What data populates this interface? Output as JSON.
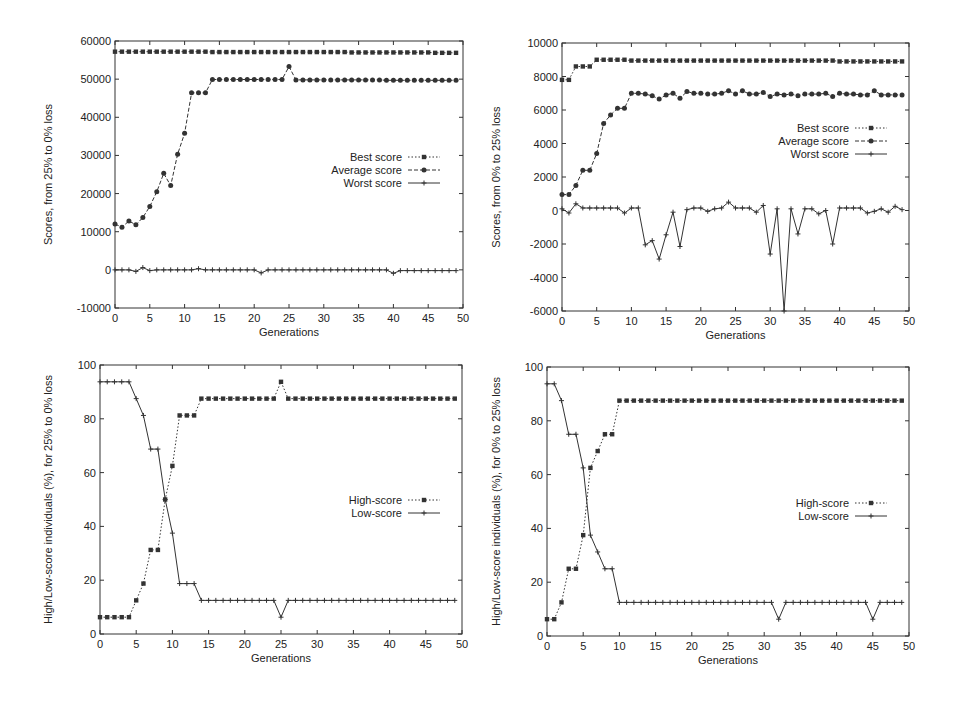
{
  "chart_data": [
    {
      "id": "top-left",
      "type": "line",
      "title": "",
      "xlabel": "Generations",
      "ylabel": "Scores, from 25% to 0% loss",
      "xlim": [
        0,
        50
      ],
      "ylim": [
        -10000,
        60000
      ],
      "xticks": [
        0,
        5,
        10,
        15,
        20,
        25,
        30,
        35,
        40,
        45,
        50
      ],
      "yticks": [
        -10000,
        0,
        10000,
        20000,
        30000,
        40000,
        50000,
        60000
      ],
      "grid": false,
      "legend_position": "center-right",
      "x": [
        0,
        1,
        2,
        3,
        4,
        5,
        6,
        7,
        8,
        9,
        10,
        11,
        12,
        13,
        14,
        15,
        16,
        17,
        18,
        19,
        20,
        21,
        22,
        23,
        24,
        25,
        26,
        27,
        28,
        29,
        30,
        31,
        32,
        33,
        34,
        35,
        36,
        37,
        38,
        39,
        40,
        41,
        42,
        43,
        44,
        45,
        46,
        47,
        48,
        49
      ],
      "series": [
        {
          "name": "Best score",
          "style": "dotted",
          "marker": "square",
          "values": [
            57200,
            57200,
            57200,
            57200,
            57200,
            57200,
            57200,
            57200,
            57200,
            57200,
            57200,
            57200,
            57200,
            57200,
            57100,
            57100,
            57100,
            57100,
            57100,
            57100,
            57100,
            57100,
            57100,
            57100,
            57100,
            57100,
            57100,
            57100,
            57100,
            57100,
            57100,
            57100,
            57100,
            57100,
            57000,
            57000,
            57000,
            57000,
            57000,
            57000,
            57000,
            57000,
            57000,
            57000,
            57000,
            57000,
            56900,
            56900,
            56900,
            56900
          ]
        },
        {
          "name": "Average score",
          "style": "dashed",
          "marker": "circle",
          "values": [
            12000,
            11200,
            12800,
            11800,
            13700,
            16600,
            20500,
            25300,
            22100,
            30300,
            35800,
            46400,
            46400,
            46400,
            49900,
            49900,
            49900,
            49900,
            49900,
            49900,
            49900,
            49900,
            49900,
            49900,
            49900,
            53300,
            49800,
            49800,
            49800,
            49800,
            49800,
            49800,
            49800,
            49800,
            49800,
            49800,
            49800,
            49800,
            49800,
            49700,
            49700,
            49700,
            49700,
            49700,
            49700,
            49700,
            49700,
            49700,
            49700,
            49700
          ]
        },
        {
          "name": "Worst score",
          "style": "solid",
          "marker": "plus",
          "values": [
            0,
            0,
            0,
            -400,
            600,
            -200,
            0,
            0,
            0,
            0,
            0,
            0,
            300,
            0,
            0,
            0,
            0,
            0,
            0,
            0,
            0,
            -800,
            0,
            0,
            0,
            0,
            0,
            0,
            0,
            0,
            0,
            0,
            0,
            0,
            0,
            0,
            0,
            0,
            0,
            0,
            -900,
            -200,
            -200,
            -200,
            -200,
            -200,
            -200,
            -200,
            -200,
            -200
          ]
        }
      ]
    },
    {
      "id": "top-right",
      "type": "line",
      "title": "",
      "xlabel": "Generations",
      "ylabel": "Scores, from 0% to 25% loss",
      "xlim": [
        0,
        50
      ],
      "ylim": [
        -6000,
        10000
      ],
      "xticks": [
        0,
        5,
        10,
        15,
        20,
        25,
        30,
        35,
        40,
        45,
        50
      ],
      "yticks": [
        -6000,
        -4000,
        -2000,
        0,
        2000,
        4000,
        6000,
        8000,
        10000
      ],
      "grid": false,
      "legend_position": "center-right",
      "x": [
        0,
        1,
        2,
        3,
        4,
        5,
        6,
        7,
        8,
        9,
        10,
        11,
        12,
        13,
        14,
        15,
        16,
        17,
        18,
        19,
        20,
        21,
        22,
        23,
        24,
        25,
        26,
        27,
        28,
        29,
        30,
        31,
        32,
        33,
        34,
        35,
        36,
        37,
        38,
        39,
        40,
        41,
        42,
        43,
        44,
        45,
        46,
        47,
        48,
        49
      ],
      "series": [
        {
          "name": "Best score",
          "style": "dotted",
          "marker": "square",
          "values": [
            7800,
            7800,
            8600,
            8600,
            8600,
            9000,
            9000,
            9000,
            9000,
            9000,
            8950,
            8950,
            8950,
            8950,
            8950,
            8950,
            8950,
            8950,
            8950,
            8950,
            8950,
            8950,
            8950,
            8950,
            8950,
            8950,
            8950,
            8950,
            8950,
            8950,
            8950,
            8950,
            8950,
            8950,
            8950,
            8950,
            8950,
            8950,
            8950,
            8950,
            8900,
            8900,
            8900,
            8900,
            8900,
            8900,
            8900,
            8900,
            8900,
            8900
          ]
        },
        {
          "name": "Average score",
          "style": "dashed",
          "marker": "circle",
          "values": [
            950,
            950,
            1500,
            2400,
            2400,
            3400,
            5200,
            5700,
            6100,
            6100,
            7000,
            7000,
            6950,
            6850,
            6650,
            6900,
            7000,
            6700,
            7100,
            7000,
            7000,
            6950,
            6950,
            7000,
            7150,
            6950,
            7150,
            6950,
            6950,
            7050,
            6800,
            6950,
            6900,
            6950,
            6850,
            6950,
            6950,
            6950,
            7000,
            6800,
            7000,
            6950,
            6950,
            6900,
            6900,
            7150,
            6900,
            6900,
            6900,
            6900
          ]
        },
        {
          "name": "Worst score",
          "style": "solid",
          "marker": "plus",
          "values": [
            100,
            -150,
            400,
            150,
            150,
            150,
            150,
            150,
            150,
            -150,
            150,
            150,
            -2050,
            -1800,
            -2900,
            -1450,
            -100,
            -2150,
            50,
            150,
            150,
            -50,
            100,
            150,
            500,
            150,
            150,
            150,
            -100,
            300,
            -2600,
            100,
            -6000,
            100,
            -1400,
            100,
            100,
            -200,
            0,
            -2000,
            150,
            150,
            150,
            150,
            -150,
            -50,
            100,
            -100,
            250,
            50
          ]
        }
      ]
    },
    {
      "id": "bottom-left",
      "type": "line",
      "title": "",
      "xlabel": "Generations",
      "ylabel": "High/Low-score individuals (%), for 25% to 0% loss",
      "xlim": [
        0,
        50
      ],
      "ylim": [
        0,
        100
      ],
      "xticks": [
        0,
        5,
        10,
        15,
        20,
        25,
        30,
        35,
        40,
        45,
        50
      ],
      "yticks": [
        0,
        20,
        40,
        60,
        80,
        100
      ],
      "grid": false,
      "legend_position": "center-right",
      "x": [
        0,
        1,
        2,
        3,
        4,
        5,
        6,
        7,
        8,
        9,
        10,
        11,
        12,
        13,
        14,
        15,
        16,
        17,
        18,
        19,
        20,
        21,
        22,
        23,
        24,
        25,
        26,
        27,
        28,
        29,
        30,
        31,
        32,
        33,
        34,
        35,
        36,
        37,
        38,
        39,
        40,
        41,
        42,
        43,
        44,
        45,
        46,
        47,
        48,
        49
      ],
      "series": [
        {
          "name": "High-score",
          "style": "dotted",
          "marker": "square",
          "values": [
            6.25,
            6.25,
            6.25,
            6.25,
            6.25,
            12.5,
            18.75,
            31.25,
            31.25,
            50,
            62.5,
            81.25,
            81.25,
            81.25,
            87.5,
            87.5,
            87.5,
            87.5,
            87.5,
            87.5,
            87.5,
            87.5,
            87.5,
            87.5,
            87.5,
            93.75,
            87.5,
            87.5,
            87.5,
            87.5,
            87.5,
            87.5,
            87.5,
            87.5,
            87.5,
            87.5,
            87.5,
            87.5,
            87.5,
            87.5,
            87.5,
            87.5,
            87.5,
            87.5,
            87.5,
            87.5,
            87.5,
            87.5,
            87.5,
            87.5
          ]
        },
        {
          "name": "Low-score",
          "style": "solid",
          "marker": "plus",
          "values": [
            93.75,
            93.75,
            93.75,
            93.75,
            93.75,
            87.5,
            81.25,
            68.75,
            68.75,
            50,
            37.5,
            18.75,
            18.75,
            18.75,
            12.5,
            12.5,
            12.5,
            12.5,
            12.5,
            12.5,
            12.5,
            12.5,
            12.5,
            12.5,
            12.5,
            6.25,
            12.5,
            12.5,
            12.5,
            12.5,
            12.5,
            12.5,
            12.5,
            12.5,
            12.5,
            12.5,
            12.5,
            12.5,
            12.5,
            12.5,
            12.5,
            12.5,
            12.5,
            12.5,
            12.5,
            12.5,
            12.5,
            12.5,
            12.5,
            12.5
          ]
        }
      ]
    },
    {
      "id": "bottom-right",
      "type": "line",
      "title": "",
      "xlabel": "Generations",
      "ylabel": "High/Low-score individuals (%), for 0% to 25% loss",
      "xlim": [
        0,
        50
      ],
      "ylim": [
        0,
        100
      ],
      "xticks": [
        0,
        5,
        10,
        15,
        20,
        25,
        30,
        35,
        40,
        45,
        50
      ],
      "yticks": [
        0,
        20,
        40,
        60,
        80,
        100
      ],
      "grid": false,
      "legend_position": "center-right",
      "x": [
        0,
        1,
        2,
        3,
        4,
        5,
        6,
        7,
        8,
        9,
        10,
        11,
        12,
        13,
        14,
        15,
        16,
        17,
        18,
        19,
        20,
        21,
        22,
        23,
        24,
        25,
        26,
        27,
        28,
        29,
        30,
        31,
        32,
        33,
        34,
        35,
        36,
        37,
        38,
        39,
        40,
        41,
        42,
        43,
        44,
        45,
        46,
        47,
        48,
        49
      ],
      "series": [
        {
          "name": "High-score",
          "style": "dotted",
          "marker": "square",
          "values": [
            6.25,
            6.25,
            12.5,
            25,
            25,
            37.5,
            62.5,
            68.75,
            75,
            75,
            87.5,
            87.5,
            87.5,
            87.5,
            87.5,
            87.5,
            87.5,
            87.5,
            87.5,
            87.5,
            87.5,
            87.5,
            87.5,
            87.5,
            87.5,
            87.5,
            87.5,
            87.5,
            87.5,
            87.5,
            87.5,
            87.5,
            87.5,
            87.5,
            87.5,
            87.5,
            87.5,
            87.5,
            87.5,
            87.5,
            87.5,
            87.5,
            87.5,
            87.5,
            87.5,
            87.5,
            87.5,
            87.5,
            87.5,
            87.5
          ]
        },
        {
          "name": "Low-score",
          "style": "solid",
          "marker": "plus",
          "values": [
            93.75,
            93.75,
            87.5,
            75,
            75,
            62.5,
            37.5,
            31.25,
            25,
            25,
            12.5,
            12.5,
            12.5,
            12.5,
            12.5,
            12.5,
            12.5,
            12.5,
            12.5,
            12.5,
            12.5,
            12.5,
            12.5,
            12.5,
            12.5,
            12.5,
            12.5,
            12.5,
            12.5,
            12.5,
            12.5,
            12.5,
            6.25,
            12.5,
            12.5,
            12.5,
            12.5,
            12.5,
            12.5,
            12.5,
            12.5,
            12.5,
            12.5,
            12.5,
            12.5,
            6.25,
            12.5,
            12.5,
            12.5,
            12.5
          ]
        }
      ]
    }
  ],
  "layout": {
    "colors": {
      "line": "#333333",
      "axis": "#333333",
      "text": "#222222",
      "background": "#ffffff"
    },
    "plots": [
      {
        "left": 115,
        "top": 41,
        "right": 463,
        "bottom": 308,
        "legend_x": 440,
        "legend_y": 157,
        "ylabel_x": 52
      },
      {
        "left": 562,
        "top": 43,
        "right": 909,
        "bottom": 311,
        "legend_x": 887,
        "legend_y": 128,
        "ylabel_x": 500
      },
      {
        "left": 100,
        "top": 365,
        "right": 462,
        "bottom": 634,
        "legend_x": 440,
        "legend_y": 500,
        "ylabel_x": 52
      },
      {
        "left": 547,
        "top": 367,
        "right": 909,
        "bottom": 636,
        "legend_x": 887,
        "legend_y": 503,
        "ylabel_x": 500
      }
    ]
  }
}
